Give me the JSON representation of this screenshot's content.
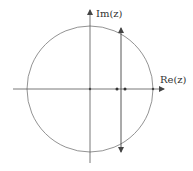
{
  "diagram": {
    "axes": {
      "real_label": "Re(z)",
      "imag_label": "Im(z)"
    },
    "colors": {
      "stroke": "#555555",
      "circle": "#777777",
      "background": "#ffffff"
    },
    "geometry": {
      "origin": [
        90,
        89
      ],
      "circle_radius": 63,
      "vertical_line_x": 121,
      "points_on_real_axis_x": [
        90,
        117,
        125,
        153
      ]
    }
  }
}
